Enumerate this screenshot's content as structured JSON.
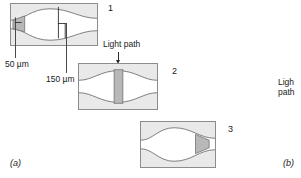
{
  "figure": {
    "subfigure_left": "(a)",
    "subfigure_right": "(b)"
  },
  "panels": [
    {
      "number": "1"
    },
    {
      "number": "2"
    },
    {
      "number": "3"
    }
  ],
  "annotations": {
    "dim_small": "50 µm",
    "dim_large": "150 µm",
    "light_path_top": "Light path",
    "light_path_right_line1": "Ligh",
    "light_path_right_line2": "path"
  },
  "colors": {
    "cell_fill": "#e9e9e9",
    "cell_border": "#8c8c8c",
    "channel_fill": "#ffffff",
    "beam_fill": "#b8b8b8",
    "curve_stroke": "#6e6e6e",
    "text": "#1a1a1a",
    "leader": "#4a4a4a"
  }
}
